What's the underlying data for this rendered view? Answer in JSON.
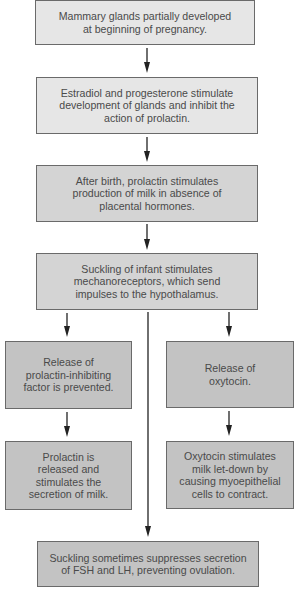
{
  "diagram": {
    "type": "flowchart",
    "nodes": [
      {
        "id": "n1",
        "text": "Mammary glands partially developed\nat beginning of pregnancy."
      },
      {
        "id": "n2",
        "text": "Estradiol and progesterone stimulate\ndevelopment of glands and inhibit the\naction of prolactin."
      },
      {
        "id": "n3",
        "text": "After birth, prolactin stimulates\nproduction of milk in absence of\nplacental hormones."
      },
      {
        "id": "n4",
        "text": "Suckling of infant stimulates\nmechanoreceptors, which send\nimpulses to the hypothalamus."
      },
      {
        "id": "n5",
        "text": "Release of\nprolactin-inhibiting\nfactor is prevented."
      },
      {
        "id": "n6",
        "text": "Release of\noxytocin."
      },
      {
        "id": "n7",
        "text": "Prolactin is\nreleased and\nstimulates the\nsecretion of milk."
      },
      {
        "id": "n8",
        "text": "Oxytocin stimulates\nmilk let-down by\ncausing myoepithelial\ncells to contract."
      },
      {
        "id": "n9",
        "text": "Suckling sometimes suppresses secretion\nof FSH and LH, preventing ovulation."
      }
    ],
    "edges": [
      {
        "from": "n1",
        "to": "n2"
      },
      {
        "from": "n2",
        "to": "n3"
      },
      {
        "from": "n3",
        "to": "n4"
      },
      {
        "from": "n4",
        "to": "n5"
      },
      {
        "from": "n4",
        "to": "n6"
      },
      {
        "from": "n4",
        "to": "n9"
      },
      {
        "from": "n5",
        "to": "n7"
      },
      {
        "from": "n6",
        "to": "n8"
      }
    ],
    "colors": {
      "light_fill": "#e6e6e6",
      "mid_fill": "#d4d4d4",
      "dark_fill": "#c3c3c3",
      "stroke": "#222222",
      "text": "#4a4a4a"
    }
  }
}
